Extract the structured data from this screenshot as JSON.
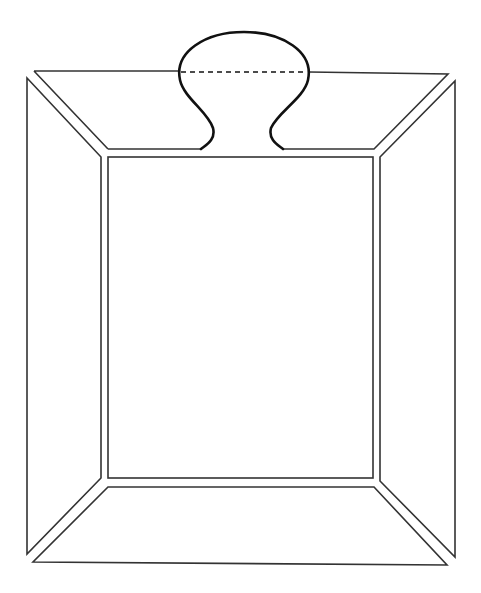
{
  "diagram": {
    "title": "",
    "stroke_color": "#333333",
    "tab_stroke_color": "#111111",
    "background": "#ffffff",
    "parts": [
      {
        "name": "center-panel",
        "shape": "rectangle"
      },
      {
        "name": "top-flap",
        "shape": "trapezoid"
      },
      {
        "name": "left-flap",
        "shape": "trapezoid"
      },
      {
        "name": "right-flap",
        "shape": "trapezoid"
      },
      {
        "name": "bottom-flap",
        "shape": "trapezoid"
      },
      {
        "name": "tab",
        "shape": "rounded-tab"
      },
      {
        "name": "tab-fold-line",
        "shape": "dashed-line"
      }
    ]
  }
}
